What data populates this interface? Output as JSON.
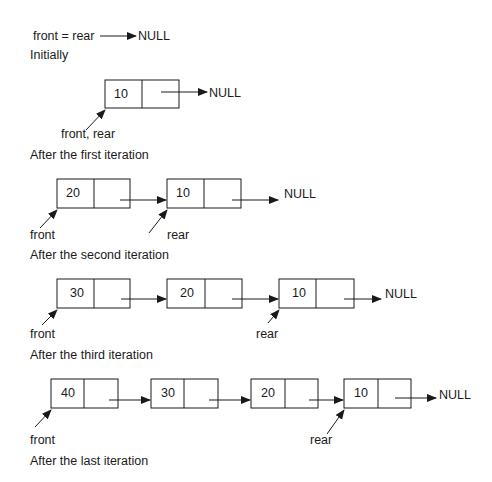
{
  "states": [
    {
      "caption": "Initially",
      "pointer_text": "front = rear",
      "null_label": "NULL",
      "nodes": []
    },
    {
      "caption": "After the first iteration",
      "pointer_label": "front, rear",
      "null_label": "NULL",
      "nodes": [
        {
          "value": "10"
        }
      ]
    },
    {
      "caption": "After the second iteration",
      "front_label": "front",
      "rear_label": "rear",
      "null_label": "NULL",
      "nodes": [
        {
          "value": "20"
        },
        {
          "value": "10"
        }
      ]
    },
    {
      "caption": "After the third iteration",
      "front_label": "front",
      "rear_label": "rear",
      "null_label": "NULL",
      "nodes": [
        {
          "value": "30"
        },
        {
          "value": "20"
        },
        {
          "value": "10"
        }
      ]
    },
    {
      "caption": "After the last iteration",
      "front_label": "front",
      "rear_label": "rear",
      "null_label": "NULL",
      "nodes": [
        {
          "value": "40"
        },
        {
          "value": "30"
        },
        {
          "value": "20"
        },
        {
          "value": "10"
        }
      ]
    }
  ],
  "colors": {
    "stroke": "#1a1a1a",
    "background": "#ffffff"
  }
}
